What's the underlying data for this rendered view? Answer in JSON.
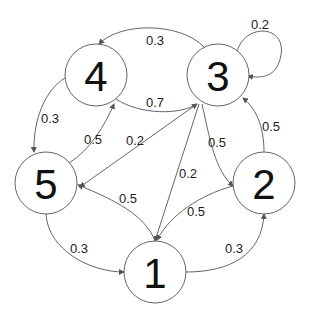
{
  "diagram": {
    "type": "markov-chain-state-diagram",
    "nodes": [
      {
        "id": "1",
        "label": "1",
        "cx": 155,
        "cy": 272,
        "r": 31
      },
      {
        "id": "2",
        "label": "2",
        "cx": 264,
        "cy": 183,
        "r": 31
      },
      {
        "id": "3",
        "label": "3",
        "cx": 218,
        "cy": 75,
        "r": 31
      },
      {
        "id": "4",
        "label": "4",
        "cx": 96,
        "cy": 75,
        "r": 31
      },
      {
        "id": "5",
        "label": "5",
        "cx": 46,
        "cy": 183,
        "r": 31
      }
    ],
    "edges": [
      {
        "from": "3",
        "to": "4",
        "weight": "0.3",
        "path": "M 204 47 C 180 22, 120 22, 99 44",
        "lx": 155,
        "ly": 40
      },
      {
        "from": "3",
        "to": "3",
        "weight": "0.2",
        "path": "M 237 52 C 245 20, 295 25, 278 65 C 272 78, 258 78, 248 76",
        "lx": 260,
        "ly": 24
      },
      {
        "from": "4",
        "to": "3",
        "weight": "0.7",
        "path": "M 116 99 C 140 115, 180 115, 197 104",
        "lx": 155,
        "ly": 102
      },
      {
        "from": "4",
        "to": "5",
        "weight": "0.3",
        "path": "M 65 78 C 45 90, 33 120, 34 152",
        "lx": 50,
        "ly": 118
      },
      {
        "from": "5",
        "to": "4",
        "weight": "0.5",
        "path": "M 69 163 C 90 150, 105 125, 114 104",
        "lx": 93,
        "ly": 139
      },
      {
        "from": "3",
        "to": "5",
        "weight": "0.2",
        "path": "M 197 104 L 80 187",
        "lx": 135,
        "ly": 140
      },
      {
        "from": "1",
        "to": "5",
        "weight": "0.5",
        "path": "M 155 241 C 145 215, 115 200, 78 185",
        "lx": 128,
        "ly": 198
      },
      {
        "from": "3",
        "to": "1",
        "weight": "0.2",
        "path": "M 199 104 L 155 241",
        "lx": 188,
        "ly": 173
      },
      {
        "from": "3",
        "to": "2",
        "weight": "0.5",
        "path": "M 202 104 C 210 140, 215 170, 233 186",
        "lx": 217,
        "ly": 142
      },
      {
        "from": "2",
        "to": "1",
        "weight": "0.5",
        "path": "M 233 186 C 200 195, 170 215, 157 240",
        "lx": 196,
        "ly": 211
      },
      {
        "from": "2",
        "to": "3",
        "weight": "0.5",
        "path": "M 264 152 C 264 130, 258 110, 243 98",
        "lx": 271,
        "ly": 126
      },
      {
        "from": "5",
        "to": "1",
        "weight": "0.3",
        "path": "M 46 214 C 48 250, 90 272, 124 272",
        "lx": 79,
        "ly": 248
      },
      {
        "from": "1",
        "to": "2",
        "weight": "0.3",
        "path": "M 186 272 C 230 272, 262 255, 264 214",
        "lx": 234,
        "ly": 248
      }
    ]
  }
}
